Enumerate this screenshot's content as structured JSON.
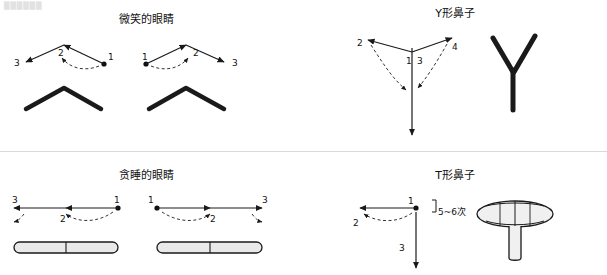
{
  "page": {
    "watermark": "██████"
  },
  "panels": [
    {
      "id": "smiling-eyes",
      "title": "微笑的眼睛",
      "stroke_labels": [
        "1",
        "2",
        "3",
        "1",
        "2",
        "3"
      ],
      "note": ""
    },
    {
      "id": "y-nose",
      "title": "Y形鼻子",
      "stroke_labels": [
        "1",
        "2",
        "3",
        "4"
      ],
      "note": ""
    },
    {
      "id": "sleepy-eyes",
      "title": "贪睡的眼睛",
      "stroke_labels": [
        "1",
        "2",
        "3",
        "1",
        "2",
        "3"
      ],
      "note": ""
    },
    {
      "id": "t-nose",
      "title": "T形鼻子",
      "stroke_labels": [
        "1",
        "2",
        "3"
      ],
      "note": "5~6次"
    }
  ],
  "colors": {
    "stroke": "#1a1a1a",
    "guide": "#444444",
    "divider": "#d9d9d9",
    "text": "#111111"
  }
}
